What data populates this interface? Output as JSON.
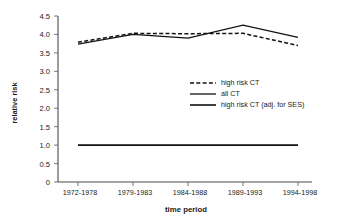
{
  "chart_data": {
    "type": "line",
    "title": "",
    "xlabel": "time period",
    "ylabel": "relative risk",
    "categories": [
      "1972-1978",
      "1979-1983",
      "1984-1988",
      "1989-1993",
      "1994-1998"
    ],
    "ylim": [
      0,
      4.5
    ],
    "yticks": [
      "0",
      "0.5",
      "1.0",
      "1.5",
      "2.0",
      "2.5",
      "3.0",
      "3.5",
      "4.0",
      "4.5"
    ],
    "ytick_values": [
      0,
      0.5,
      1.0,
      1.5,
      2.0,
      2.5,
      3.0,
      3.5,
      4.0,
      4.5
    ],
    "grid": false,
    "legend_position": "center-right",
    "series": [
      {
        "name": "high risk CT",
        "style": "dashed",
        "values": [
          3.79,
          4.03,
          4.02,
          4.03,
          3.7
        ]
      },
      {
        "name": "all CT",
        "style": "solid",
        "values": [
          3.74,
          4.0,
          3.9,
          4.25,
          3.92
        ]
      },
      {
        "name": "high risk CT (adj. for SES)",
        "style": "solid",
        "values": [
          1.0,
          1.0,
          1.0,
          1.0,
          1.0
        ]
      }
    ]
  },
  "colors": {
    "line": "#111111",
    "axis": "#4a4a4a",
    "background": "#ffffff",
    "text": "#1a1a1a"
  }
}
